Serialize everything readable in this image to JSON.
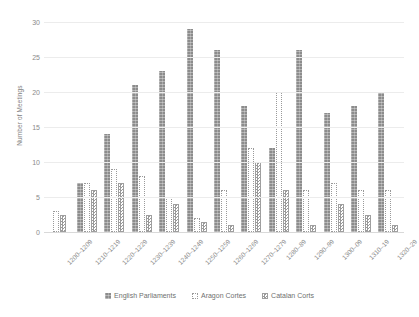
{
  "chart_data": {
    "type": "bar",
    "title": "",
    "xlabel": "",
    "ylabel": "Number of Meetings",
    "ylim": [
      0,
      30
    ],
    "yticks": [
      0,
      5,
      10,
      15,
      20,
      25,
      30
    ],
    "grid": true,
    "legend_position": "bottom",
    "categories": [
      "1200–1209",
      "1210–1219",
      "1220–1229",
      "1230–1239",
      "1240–1249",
      "1250–1259",
      "1260–1269",
      "1270–1279",
      "1280–89",
      "1290–99",
      "1300–09",
      "1310–19",
      "1320–29"
    ],
    "series": [
      {
        "name": "English Parliaments",
        "style": "solid-gray",
        "values": [
          0,
          7,
          14,
          21,
          23,
          29,
          26,
          18,
          12,
          26,
          17,
          18,
          20
        ]
      },
      {
        "name": "Aragon Cortes",
        "style": "white-dotted-outline",
        "values": [
          3,
          7,
          9,
          8,
          5,
          2,
          6,
          12,
          20,
          6,
          7,
          6,
          6
        ]
      },
      {
        "name": "Catalan Corts",
        "style": "checkered",
        "values": [
          2.5,
          6,
          7,
          2.5,
          4,
          1.5,
          1,
          10,
          6,
          1,
          4,
          2.5,
          1
        ]
      }
    ]
  },
  "legend": {
    "items": [
      {
        "label": "English Parliaments"
      },
      {
        "label": "Aragon Cortes"
      },
      {
        "label": "Catalan Corts"
      }
    ]
  },
  "colors": {
    "english": "#8c8c8c",
    "aragon": "#ffffff",
    "catalan": "#9a9a9a",
    "grid": "#ececec",
    "text": "#8a8a8a"
  }
}
